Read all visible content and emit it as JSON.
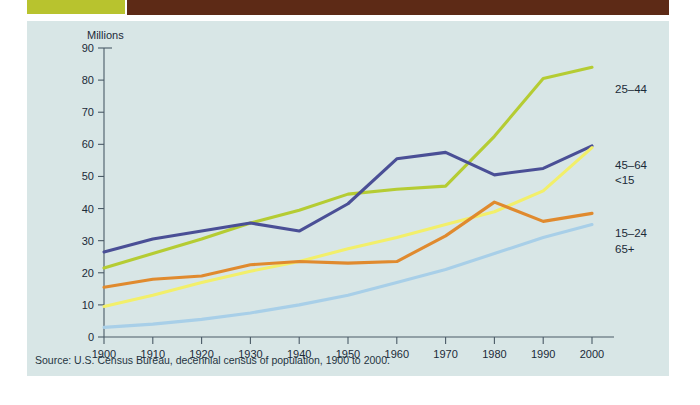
{
  "banner": {
    "title": ""
  },
  "panel": {
    "axis_note": "Millions",
    "source": "Source: U.S. Census Bureau, decennial census of population, 1900 to 2000."
  },
  "chart_data": {
    "type": "line",
    "title": "",
    "xlabel": "",
    "ylabel": "Millions",
    "xlim": [
      1900,
      2000
    ],
    "ylim": [
      0,
      90
    ],
    "ytick_step": 10,
    "grid": false,
    "legend_position": "right-inline",
    "x": [
      1900,
      1910,
      1920,
      1930,
      1940,
      1950,
      1960,
      1970,
      1980,
      1990,
      2000
    ],
    "xtick_labels": [
      "1900",
      "1910",
      "1920",
      "1930",
      "1940",
      "1950",
      "1960",
      "1970",
      "1980",
      "1990",
      "2000"
    ],
    "ytick_labels": [
      "0",
      "10",
      "20",
      "30",
      "40",
      "50",
      "60",
      "70",
      "80",
      "90"
    ],
    "series": [
      {
        "name": "25-44",
        "label": "25–44",
        "color": "#b5cc33",
        "values": [
          21.5,
          26.0,
          30.5,
          35.5,
          39.5,
          44.5,
          46.0,
          47.0,
          62.5,
          80.5,
          84.0
        ]
      },
      {
        "name": "45-64",
        "label": "45–64",
        "color": "#4a4f96",
        "values": [
          26.5,
          30.5,
          33.0,
          35.5,
          33.0,
          41.5,
          55.5,
          57.5,
          50.5,
          52.5,
          59.5
        ]
      },
      {
        "name": "<15",
        "label": "<15",
        "color": "#f2ef6a",
        "values": [
          9.5,
          13.0,
          17.0,
          20.5,
          23.5,
          27.5,
          31.0,
          35.0,
          39.0,
          45.5,
          59.0
        ]
      },
      {
        "name": "15-24",
        "label": "15–24",
        "color": "#e08a2e",
        "values": [
          15.5,
          18.0,
          19.0,
          22.5,
          23.5,
          23.0,
          23.5,
          31.5,
          42.0,
          36.0,
          38.5
        ]
      },
      {
        "name": "65+",
        "label": "65+",
        "color": "#a8cfe8",
        "values": [
          3.0,
          4.0,
          5.5,
          7.5,
          10.0,
          13.0,
          17.0,
          21.0,
          26.0,
          31.0,
          35.0
        ]
      }
    ],
    "series_labels_right": [
      {
        "label": "25–44",
        "x": 588,
        "y": 72
      },
      {
        "label": "45–64",
        "x": 588,
        "y": 148
      },
      {
        "label": "<15",
        "x": 588,
        "y": 163
      },
      {
        "label": "15–24",
        "x": 588,
        "y": 216
      },
      {
        "label": "65+",
        "x": 588,
        "y": 232
      }
    ]
  }
}
